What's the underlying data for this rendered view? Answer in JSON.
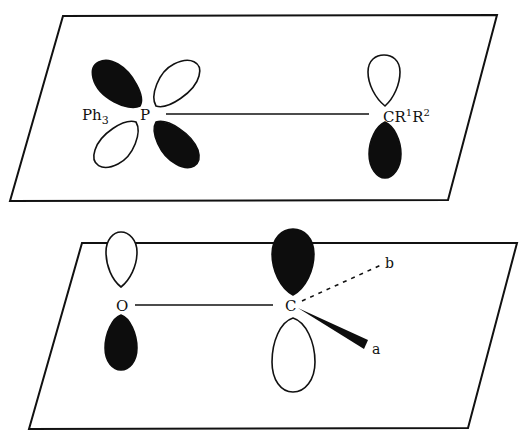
{
  "diagram": {
    "caption_cut": "",
    "top_panel": {
      "description": "Phosphorus ylide: P d-orbital overlapping with carbon p-orbital in one plane",
      "labels": {
        "ph3": "Ph",
        "ph3_sub": "3",
        "p": "P",
        "cr": "CR",
        "r1_sup": "1",
        "r": "R",
        "r2_sup": "2"
      }
    },
    "bottom_panel": {
      "description": "Carbonyl: O p-orbital and C p-orbital with substituents a (wedge) and b (dashed)",
      "labels": {
        "o": "O",
        "c": "C",
        "a": "a",
        "b": "b"
      }
    },
    "colors": {
      "ink": "#111111",
      "filled_lobe": "#0d0d0d",
      "background": "#ffffff"
    }
  }
}
